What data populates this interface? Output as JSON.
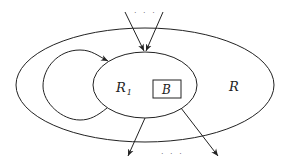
{
  "diagram": {
    "type": "region-nesting",
    "regions": [
      {
        "id": "R",
        "label": "R",
        "shape": "ellipse",
        "role": "outer region"
      },
      {
        "id": "R1",
        "label": "R",
        "subscript": "1",
        "shape": "ellipse",
        "role": "inner region"
      },
      {
        "id": "B",
        "label": "B",
        "shape": "rectangle",
        "role": "block"
      }
    ],
    "edges": [
      {
        "from": "external",
        "to": "R1",
        "note": "incoming edges (two shown)"
      },
      {
        "from": "R1",
        "to": "R1",
        "note": "loop back edge within R"
      },
      {
        "from": "R1",
        "to": "external",
        "note": "outgoing edge"
      },
      {
        "from": "B",
        "to": "external",
        "note": "outgoing edge"
      }
    ],
    "ellipsis_top": "· · ·",
    "ellipsis_bottom": "· · ·"
  },
  "colors": {
    "stroke": "#222222",
    "background": "#ffffff"
  }
}
